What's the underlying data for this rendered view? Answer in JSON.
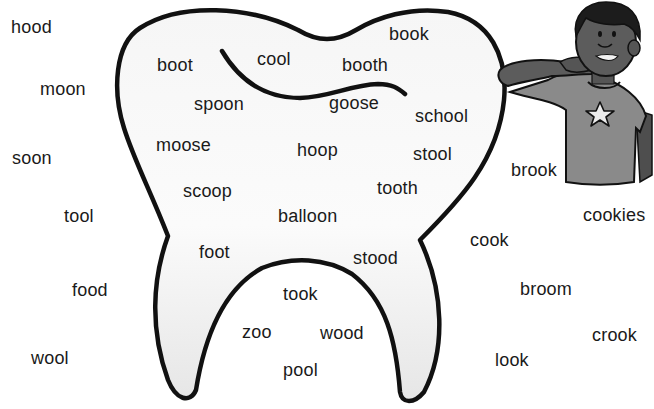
{
  "worksheet": {
    "theme": "oo words — tooth sorting",
    "colors": {
      "outline": "#111111",
      "tooth_fill_top": "#f7f7f7",
      "tooth_fill_bottom": "#e9e9e9",
      "skin": "#5a5a5a",
      "shirt": "#8c8c8c",
      "hair": "#1e1e1e",
      "star": "#e8e8e8",
      "text": "#1a1a1a"
    },
    "inside_tooth_words": [
      {
        "text": "book",
        "x": 389,
        "y": 25
      },
      {
        "text": "cool",
        "x": 257,
        "y": 50
      },
      {
        "text": "boot",
        "x": 157,
        "y": 56
      },
      {
        "text": "booth",
        "x": 342,
        "y": 56
      },
      {
        "text": "spoon",
        "x": 194,
        "y": 95
      },
      {
        "text": "goose",
        "x": 329,
        "y": 94
      },
      {
        "text": "school",
        "x": 415,
        "y": 107
      },
      {
        "text": "moose",
        "x": 156,
        "y": 136
      },
      {
        "text": "hoop",
        "x": 297,
        "y": 141
      },
      {
        "text": "stool",
        "x": 413,
        "y": 145
      },
      {
        "text": "scoop",
        "x": 183,
        "y": 182
      },
      {
        "text": "tooth",
        "x": 377,
        "y": 179
      },
      {
        "text": "balloon",
        "x": 278,
        "y": 207
      },
      {
        "text": "foot",
        "x": 199,
        "y": 243
      },
      {
        "text": "stood",
        "x": 353,
        "y": 249
      },
      {
        "text": "took",
        "x": 283,
        "y": 285
      },
      {
        "text": "zoo",
        "x": 242,
        "y": 323
      },
      {
        "text": "wood",
        "x": 320,
        "y": 324
      },
      {
        "text": "pool",
        "x": 283,
        "y": 361
      }
    ],
    "outside_tooth_words": [
      {
        "text": "hood",
        "x": 11,
        "y": 18
      },
      {
        "text": "moon",
        "x": 40,
        "y": 80
      },
      {
        "text": "soon",
        "x": 12,
        "y": 149
      },
      {
        "text": "tool",
        "x": 64,
        "y": 207
      },
      {
        "text": "food",
        "x": 72,
        "y": 281
      },
      {
        "text": "wool",
        "x": 31,
        "y": 349
      },
      {
        "text": "brook",
        "x": 511,
        "y": 161
      },
      {
        "text": "cookies",
        "x": 583,
        "y": 206
      },
      {
        "text": "cook",
        "x": 470,
        "y": 231
      },
      {
        "text": "broom",
        "x": 520,
        "y": 280
      },
      {
        "text": "crook",
        "x": 592,
        "y": 326
      },
      {
        "text": "look",
        "x": 495,
        "y": 351
      }
    ],
    "illustrations": [
      {
        "name": "tooth-outline",
        "label": "large molar outline"
      },
      {
        "name": "boy-brushing-teeth",
        "label": "boy brushing teeth with star shirt"
      }
    ]
  }
}
